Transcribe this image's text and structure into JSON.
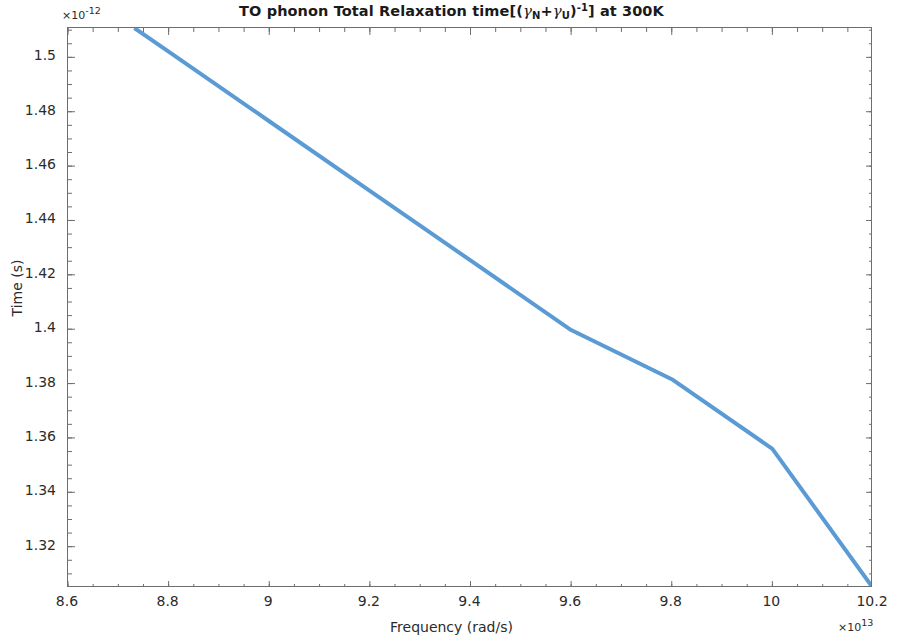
{
  "chart_data": {
    "type": "line",
    "title": "TO phonon Total Relaxation time[(γN+γU)-1] at 300K",
    "title_parts": {
      "lead": "TO phonon Total Relaxation time[(",
      "gamma1": "γ",
      "sub1": "N",
      "plus": "+",
      "gamma2": "γ",
      "sub2": "U",
      "close": ")",
      "sup": "-1",
      "tail": "] at 300K"
    },
    "xlabel": "Frequency (rad/s)",
    "ylabel": "Time (s)",
    "x_multiplier_prefix": "×10",
    "x_multiplier_exponent": "13",
    "y_multiplier_prefix": "×10",
    "y_multiplier_exponent": "-12",
    "xlim": [
      8.6,
      10.2
    ],
    "ylim": [
      1.3048,
      1.5108
    ],
    "xticks": [
      "8.6",
      "8.8",
      "9",
      "9.2",
      "9.4",
      "9.6",
      "9.8",
      "10",
      "10.2"
    ],
    "xtick_values": [
      8.6,
      8.8,
      9.0,
      9.2,
      9.4,
      9.6,
      9.8,
      10.0,
      10.2
    ],
    "yticks": [
      "1.5",
      "1.48",
      "1.46",
      "1.44",
      "1.42",
      "1.4",
      "1.38",
      "1.36",
      "1.34",
      "1.32"
    ],
    "ytick_values": [
      1.5,
      1.48,
      1.46,
      1.44,
      1.42,
      1.4,
      1.38,
      1.36,
      1.34,
      1.32
    ],
    "grid": false,
    "minor_ticks": true,
    "legend": null,
    "line_color": "#5B9BD5",
    "line_width": 4,
    "series": [
      {
        "name": "TO phonon total relaxation time",
        "x": [
          8.732,
          8.8,
          9.0,
          9.2,
          9.4,
          9.6,
          9.8,
          10.0,
          10.2
        ],
        "y": [
          1.5108,
          1.5021,
          1.4765,
          1.4509,
          1.4253,
          1.3997,
          1.3816,
          1.356,
          1.3048
        ],
        "x_units": "1e13 rad/s",
        "y_units": "1e-12 s"
      }
    ]
  }
}
